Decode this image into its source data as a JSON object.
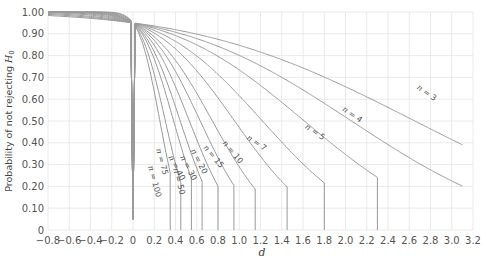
{
  "chart_data": {
    "type": "line",
    "title": "",
    "xlabel": "d",
    "ylabel": "Probability of not rejecting H0",
    "ylabel_parts": {
      "text": "Probability of not rejecting ",
      "symbol": "H",
      "subscript": "0"
    },
    "xlim": [
      -0.8,
      3.2
    ],
    "ylim": [
      0,
      1.0
    ],
    "grid": true,
    "legend": "inline curve labels",
    "x_ticks": [
      "−0.8",
      "−0.6",
      "−0.4",
      "−0.2",
      "0",
      "0.2",
      "0.4",
      "0.6",
      "0.8",
      "1.0",
      "1.2",
      "1.4",
      "1.6",
      "1.8",
      "2.0",
      "2.2",
      "2.4",
      "2.6",
      "2.8",
      "3.0",
      "3.2"
    ],
    "y_ticks": [
      "0",
      "0.10",
      "0.20",
      "0.30",
      "0.40",
      "0.50",
      "0.60",
      "0.70",
      "0.80",
      "0.90",
      "1.00"
    ],
    "curve_color": "#999999",
    "grid_color": "#e4e4e4",
    "alpha": 0.05,
    "series": [
      {
        "name": "n = 3",
        "n": 3,
        "label": "n = 3",
        "end_d": 3.1,
        "end_value": 0.03,
        "label_pos": [
          2.75,
          0.62
        ]
      },
      {
        "name": "n = 4",
        "n": 4,
        "label": "n = 4",
        "end_d": 3.1,
        "end_value": 0.01,
        "label_pos": [
          2.05,
          0.52
        ]
      },
      {
        "name": "n = 5",
        "n": 5,
        "label": "n = 5",
        "end_d": 2.3,
        "end_value": 0.0,
        "label_pos": [
          1.7,
          0.44
        ]
      },
      {
        "name": "n = 7",
        "n": 7,
        "label": "n = 7",
        "end_d": 1.8,
        "end_value": 0.0,
        "label_pos": [
          1.15,
          0.39
        ]
      },
      {
        "name": "n = 10",
        "n": 10,
        "label": "n = 10",
        "end_d": 1.45,
        "end_value": 0.0,
        "label_pos": [
          0.92,
          0.35
        ]
      },
      {
        "name": "n = 15",
        "n": 15,
        "label": "n = 15",
        "end_d": 1.15,
        "end_value": 0.0,
        "label_pos": [
          0.74,
          0.33
        ]
      },
      {
        "name": "n = 20",
        "n": 20,
        "label": "n = 20",
        "end_d": 0.95,
        "end_value": 0.0,
        "label_pos": [
          0.6,
          0.31
        ]
      },
      {
        "name": "n = 30",
        "n": 30,
        "label": "n = 30",
        "end_d": 0.8,
        "end_value": 0.0,
        "label_pos": [
          0.5,
          0.28
        ]
      },
      {
        "name": "n = 40",
        "n": 40,
        "label": "n = 40",
        "end_d": 0.65,
        "end_value": 0.0,
        "label_pos": [
          0.39,
          0.28
        ]
      },
      {
        "name": "n = 50",
        "n": 50,
        "label": "n = 50",
        "end_d": 0.55,
        "end_value": 0.0,
        "label_pos": [
          0.41,
          0.22
        ]
      },
      {
        "name": "n = 75",
        "n": 75,
        "label": "n = 75",
        "end_d": 0.45,
        "end_value": 0.0,
        "label_pos": [
          0.25,
          0.31
        ]
      },
      {
        "name": "n = 100",
        "n": 100,
        "label": "n = 100",
        "end_d": 0.35,
        "end_value": 0.0,
        "label_pos": [
          0.18,
          0.22
        ]
      }
    ],
    "key_points": {
      "left_edge_value_at_d_minus_0_8": 1.0,
      "convergence_point": [
        0.0,
        0.95
      ]
    }
  }
}
